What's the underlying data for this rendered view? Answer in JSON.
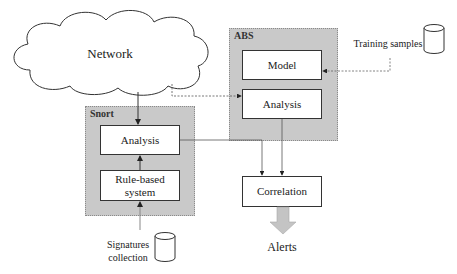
{
  "diagram": {
    "cloud": {
      "label": "Network"
    },
    "groups": {
      "snort": {
        "label": "Snort"
      },
      "abs": {
        "label": "ABS"
      }
    },
    "boxes": {
      "snort_analysis": "Analysis",
      "rule_based": "Rule-based system",
      "abs_model": "Model",
      "abs_analysis": "Analysis",
      "correlation": "Correlation"
    },
    "data_stores": {
      "training": "Training samples",
      "signatures": "Signatures collection"
    },
    "output": {
      "label": "Alerts"
    },
    "edges": [
      {
        "from": "Network",
        "to": "Snort Analysis",
        "style": "solid"
      },
      {
        "from": "Network",
        "to": "ABS Analysis",
        "style": "dashed"
      },
      {
        "from": "Training samples",
        "to": "Model",
        "style": "dashed"
      },
      {
        "from": "Rule-based system",
        "to": "Snort Analysis",
        "style": "solid"
      },
      {
        "from": "Signatures collection",
        "to": "Rule-based system",
        "style": "solid"
      },
      {
        "from": "Snort Analysis",
        "to": "Correlation",
        "style": "dashed"
      },
      {
        "from": "ABS Analysis",
        "to": "Correlation",
        "style": "solid"
      },
      {
        "from": "Correlation",
        "to": "Alerts",
        "style": "block-arrow"
      }
    ],
    "colors": {
      "group_fill": "#c9c9c9",
      "box_fill": "#ffffff",
      "stroke": "#333333",
      "block_arrow": "#c4c4c4"
    }
  }
}
